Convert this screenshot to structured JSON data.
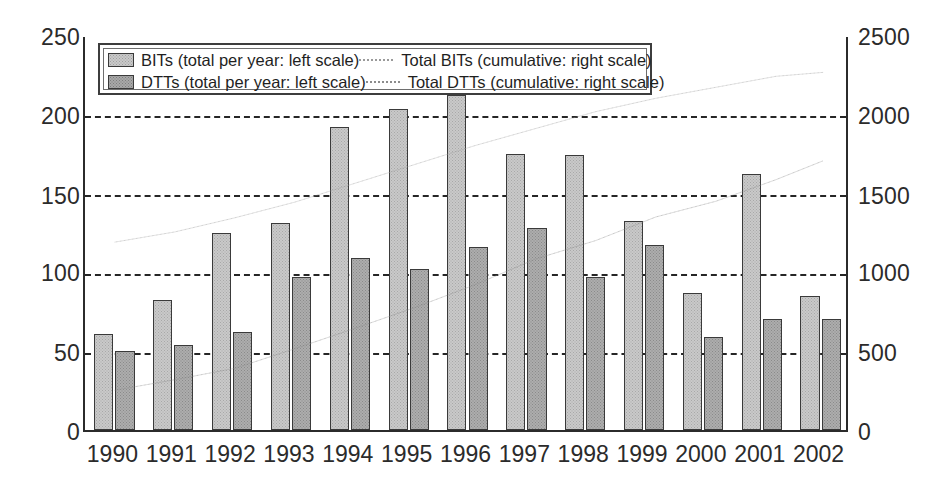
{
  "chart_data": {
    "type": "bar",
    "title": "",
    "subtitle": "",
    "xlabel": "",
    "ylabel": "",
    "y2label": "",
    "categories": [
      "1990",
      "1991",
      "1992",
      "1993",
      "1994",
      "1995",
      "1996",
      "1997",
      "1998",
      "1999",
      "2000",
      "2001",
      "2002"
    ],
    "ylim": [
      0,
      250
    ],
    "y2lim": [
      0,
      2500
    ],
    "yticks": [
      "0",
      "50",
      "100",
      "150",
      "200",
      "250"
    ],
    "y2ticks": [
      "0",
      "500",
      "1000",
      "1500",
      "2000",
      "2500"
    ],
    "grid": true,
    "legend_position": "top-left-inside",
    "series": [
      {
        "name": "BITs (total per year: left scale)",
        "kind": "bar",
        "axis": "left",
        "color": "#c9c9c9",
        "values": [
          61,
          82,
          125,
          131,
          192,
          203,
          212,
          175,
          174,
          132,
          87,
          162,
          85
        ]
      },
      {
        "name": "DTTs (total per year: left scale)",
        "kind": "bar",
        "axis": "left",
        "color": "#adadad",
        "values": [
          50,
          54,
          62,
          97,
          109,
          102,
          116,
          128,
          97,
          117,
          59,
          70,
          70
        ]
      },
      {
        "name": "Total BITs (cumulative: right scale)",
        "kind": "line",
        "axis": "right",
        "color": "#9a9a9a",
        "values": [
          1200,
          1280,
          1400,
          1530,
          1720,
          1920,
          2130,
          2305,
          2480,
          2610,
          2700,
          2860,
          2940
        ]
      },
      {
        "name": "Total DTTs (cumulative: right scale)",
        "kind": "line",
        "axis": "right",
        "color": "#8c8c8c",
        "values": [
          450,
          505,
          565,
          665,
          770,
          875,
          990,
          1120,
          1215,
          1335,
          1395,
          1465,
          1535
        ]
      }
    ],
    "line_render": {
      "bits_points_pct": [
        [
          3.9,
          52.2
        ],
        [
          11.8,
          49.6
        ],
        [
          19.7,
          46.0
        ],
        [
          27.6,
          42.0
        ],
        [
          35.5,
          37.2
        ],
        [
          43.4,
          32.4
        ],
        [
          51.3,
          27.6
        ],
        [
          59.2,
          23.3
        ],
        [
          67.1,
          19.0
        ],
        [
          75.0,
          15.6
        ],
        [
          82.9,
          12.8
        ],
        [
          90.8,
          10.0
        ],
        [
          97.0,
          9.0
        ]
      ],
      "dtts_points_pct": [
        [
          3.9,
          89.9
        ],
        [
          11.8,
          87.2
        ],
        [
          19.7,
          84.3
        ],
        [
          27.6,
          79.3
        ],
        [
          35.5,
          74.1
        ],
        [
          43.4,
          68.8
        ],
        [
          51.3,
          63.0
        ],
        [
          59.2,
          56.5
        ],
        [
          67.1,
          51.8
        ],
        [
          75.0,
          45.8
        ],
        [
          82.9,
          41.8
        ],
        [
          90.8,
          36.3
        ],
        [
          97.0,
          31.5
        ]
      ]
    }
  },
  "legend": {
    "items": [
      {
        "label": "BITs (total per year: left scale)",
        "marker": "swatch-light"
      },
      {
        "label": "DTTs (total per year: left scale)",
        "marker": "swatch-dark"
      },
      {
        "label": "Total BITs (cumulative: right scale)",
        "marker": "line-light"
      },
      {
        "label": "Total DTTs (cumulative: right scale)",
        "marker": "line-dark"
      }
    ]
  }
}
